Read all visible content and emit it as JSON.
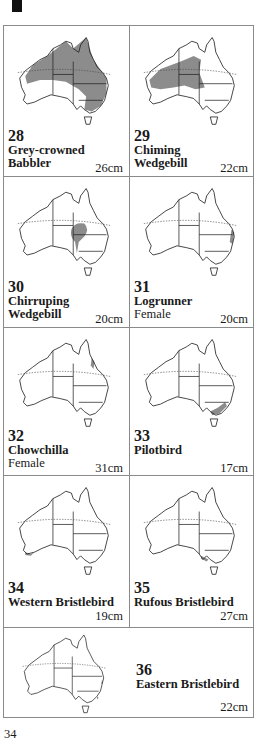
{
  "page": {
    "number": "34"
  },
  "entries": [
    {
      "num": "28",
      "name_line1": "Grey-crowned",
      "name_line2": "Babbler",
      "sub": "",
      "size": "26cm",
      "range": "north-east"
    },
    {
      "num": "29",
      "name_line1": "Chiming",
      "name_line2": "Wedgebill",
      "sub": "",
      "size": "22cm",
      "range": "central-west"
    },
    {
      "num": "30",
      "name_line1": "Chirruping",
      "name_line2": "Wedgebill",
      "sub": "",
      "size": "20cm",
      "range": "central-east-blob"
    },
    {
      "num": "31",
      "name_line1": "Logrunner",
      "name_line2": "",
      "sub": "Female",
      "size": "20cm",
      "range": "east-coast-strip"
    },
    {
      "num": "32",
      "name_line1": "Chowchilla",
      "name_line2": "",
      "sub": "Female",
      "size": "31cm",
      "range": "ne-queensland-strip"
    },
    {
      "num": "33",
      "name_line1": "Pilotbird",
      "name_line2": "",
      "sub": "",
      "size": "17cm",
      "range": "south-east-patch"
    },
    {
      "num": "34",
      "name_line1": "Western Bristlebird",
      "name_line2": "",
      "sub": "",
      "size": "19cm",
      "range": "south-west-coast"
    },
    {
      "num": "35",
      "name_line1": "Rufous Bristlebird",
      "name_line2": "",
      "sub": "",
      "size": "27cm",
      "range": "south-coast-vic"
    },
    {
      "num": "36",
      "name_line1": "Eastern Bristlebird",
      "name_line2": "",
      "sub": "",
      "size": "22cm",
      "range": "east-coast-dots"
    }
  ],
  "colors": {
    "range_fill": "#8c8c8c",
    "outline": "#222222",
    "border": "#8a8a8a"
  }
}
